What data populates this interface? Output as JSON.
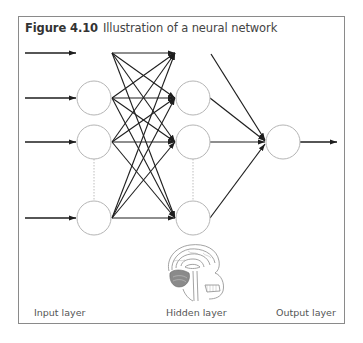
{
  "figure": {
    "number": "Figure 4.10",
    "caption": "Illustration of a neural network"
  },
  "layers": {
    "input_label": "Input layer",
    "hidden_label": "Hidden layer",
    "output_label": "Output layer"
  },
  "network": {
    "input_nodes_visible": 3,
    "hidden_nodes_visible": 3,
    "output_nodes": 1,
    "input_arrows": 4,
    "connections": "fully connected",
    "ellipsis_between_nodes": "dotted line"
  },
  "illustration": "brain-cross-section",
  "colors": {
    "node_stroke": "#b5b5b5",
    "edge": "#1e1e1e",
    "frame": "#8a8a8a",
    "dotted": "#bdbdbd"
  }
}
